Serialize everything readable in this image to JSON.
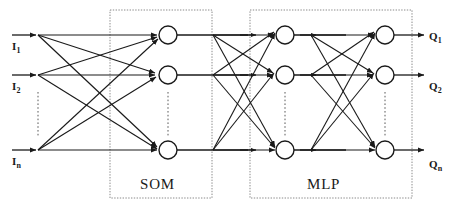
{
  "figure": {
    "type": "neural-network-architecture-diagram",
    "background_color": "#ffffff",
    "stroke_color": "#1a1a1a",
    "box_border_color": "#808080",
    "width": 456,
    "height": 211
  },
  "inputs": {
    "labels": [
      "I",
      "I",
      "I"
    ],
    "subscripts": [
      "1",
      "2",
      "n"
    ],
    "full_labels": [
      "I1",
      "I2",
      "In"
    ],
    "ellipsis": "vertical-dots"
  },
  "outputs": {
    "labels": [
      "Q",
      "Q",
      "Q"
    ],
    "subscripts": [
      "1",
      "2",
      "n"
    ],
    "full_labels": [
      "Q1",
      "Q2",
      "Qn"
    ],
    "ellipsis": "vertical-dots"
  },
  "modules": [
    {
      "id": "som",
      "label": "SOM",
      "x": 110,
      "y": 10,
      "w": 102,
      "h": 188
    },
    {
      "id": "mlp",
      "label": "MLP",
      "x": 250,
      "y": 10,
      "w": 162,
      "h": 188
    }
  ],
  "layers": [
    {
      "id": "input-fanout",
      "x": 38,
      "nodes": 3,
      "node_shape": "none"
    },
    {
      "id": "som-layer",
      "x": 168,
      "nodes": 3,
      "node_shape": "circle"
    },
    {
      "id": "mlp-hidden",
      "x": 285,
      "nodes": 3,
      "node_shape": "circle"
    },
    {
      "id": "mlp-output",
      "x": 385,
      "nodes": 3,
      "node_shape": "circle"
    }
  ],
  "row_y": [
    35,
    75,
    150
  ],
  "node_radius": 9,
  "connections": {
    "input_to_som": "fully-connected",
    "som_to_mlp_hidden": "fully-connected",
    "mlp_hidden_to_mlp_output": "fully-connected",
    "arrowheads": "filled-triangle"
  }
}
